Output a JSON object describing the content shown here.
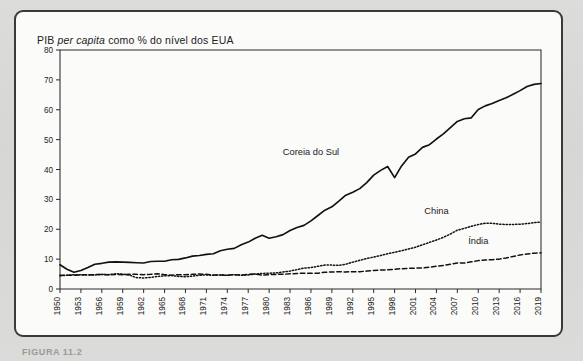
{
  "figure": {
    "title_prefix": "PIB ",
    "title_italic": "per capita",
    "title_suffix": " como % do nível dos EUA",
    "title_full": "PIB per capita como % do nível dos EUA",
    "caption": "FIGURA 11.2"
  },
  "chart_data": {
    "type": "line",
    "title": "PIB per capita como % do nível dos EUA",
    "xlabel": "",
    "ylabel": "",
    "ylim": [
      0,
      80
    ],
    "ytick_values": [
      0,
      10,
      20,
      30,
      40,
      50,
      60,
      70,
      80
    ],
    "ytick_labels": [
      "0",
      "10",
      "20",
      "30",
      "40",
      "50",
      "60",
      "70",
      "80"
    ],
    "xlim": [
      1950,
      2019
    ],
    "xtick_labels": [
      "1950",
      "1953",
      "1956",
      "1959",
      "1962",
      "1965",
      "1968",
      "1971",
      "1974",
      "1977",
      "1980",
      "1983",
      "1986",
      "1989",
      "1992",
      "1995",
      "1998",
      "2001",
      "2004",
      "2007",
      "2010",
      "2013",
      "2016",
      "2019"
    ],
    "grid": false,
    "legend_position": "inline-annotations",
    "x": [
      1950,
      1951,
      1952,
      1953,
      1954,
      1955,
      1956,
      1957,
      1958,
      1959,
      1960,
      1961,
      1962,
      1963,
      1964,
      1965,
      1966,
      1967,
      1968,
      1969,
      1970,
      1971,
      1972,
      1973,
      1974,
      1975,
      1976,
      1977,
      1978,
      1979,
      1980,
      1981,
      1982,
      1983,
      1984,
      1985,
      1986,
      1987,
      1988,
      1989,
      1990,
      1991,
      1992,
      1993,
      1994,
      1995,
      1996,
      1997,
      1998,
      1999,
      2000,
      2001,
      2002,
      2003,
      2004,
      2005,
      2006,
      2007,
      2008,
      2009,
      2010,
      2011,
      2012,
      2013,
      2014,
      2015,
      2016,
      2017,
      2018,
      2019
    ],
    "series": [
      {
        "name": "Coreia do Sul",
        "style": "solid",
        "label_x": 1986,
        "label_y": 45,
        "values": [
          8.1,
          6.6,
          5.6,
          6.2,
          7.2,
          8.3,
          8.6,
          9.0,
          9.1,
          9.0,
          8.9,
          8.8,
          8.7,
          9.2,
          9.3,
          9.3,
          9.8,
          9.9,
          10.4,
          11.0,
          11.2,
          11.6,
          11.8,
          12.8,
          13.3,
          13.6,
          14.8,
          15.7,
          17.0,
          18.0,
          17.0,
          17.5,
          18.2,
          19.6,
          20.6,
          21.3,
          22.8,
          24.6,
          26.4,
          27.5,
          29.4,
          31.4,
          32.4,
          33.6,
          35.6,
          38.1,
          39.7,
          41.0,
          37.3,
          41.2,
          44.1,
          45.2,
          47.4,
          48.3,
          50.2,
          51.9,
          54.0,
          56.1,
          57.0,
          57.3,
          60.1,
          61.3,
          62.1,
          63.1,
          64.0,
          65.2,
          66.4,
          67.8,
          68.5,
          68.8
        ]
      },
      {
        "name": "China",
        "style": "dotted",
        "label_x": 2004,
        "label_y": 25,
        "values": [
          4.4,
          4.6,
          4.8,
          4.8,
          4.7,
          4.7,
          4.9,
          4.8,
          5.1,
          5.0,
          4.6,
          3.8,
          3.7,
          3.9,
          4.2,
          4.4,
          4.5,
          4.2,
          4.1,
          4.3,
          4.6,
          4.7,
          4.6,
          4.7,
          4.6,
          4.8,
          4.6,
          4.7,
          5.0,
          5.2,
          5.3,
          5.4,
          5.7,
          6.0,
          6.5,
          7.0,
          7.2,
          7.6,
          8.0,
          8.0,
          7.9,
          8.3,
          9.0,
          9.6,
          10.2,
          10.7,
          11.2,
          11.8,
          12.3,
          12.8,
          13.4,
          14.0,
          14.8,
          15.6,
          16.4,
          17.3,
          18.4,
          19.7,
          20.3,
          21.0,
          21.6,
          22.0,
          22.0,
          21.7,
          21.6,
          21.6,
          21.7,
          21.9,
          22.2,
          22.4
        ]
      },
      {
        "name": "Índia",
        "style": "dashed",
        "label_x": 2010,
        "label_y": 15,
        "values": [
          4.6,
          4.6,
          4.6,
          4.7,
          4.8,
          4.8,
          4.9,
          4.7,
          4.9,
          4.8,
          4.9,
          4.9,
          4.8,
          4.9,
          5.1,
          4.8,
          4.6,
          4.8,
          4.8,
          4.9,
          5.0,
          4.9,
          4.7,
          4.7,
          4.6,
          4.8,
          4.7,
          4.9,
          5.0,
          4.6,
          4.8,
          4.9,
          4.9,
          5.1,
          5.2,
          5.3,
          5.3,
          5.3,
          5.6,
          5.7,
          5.8,
          5.7,
          5.8,
          5.8,
          6.0,
          6.2,
          6.4,
          6.4,
          6.6,
          6.8,
          6.9,
          7.0,
          7.0,
          7.3,
          7.6,
          7.9,
          8.3,
          8.7,
          8.7,
          9.1,
          9.5,
          9.7,
          9.8,
          10.0,
          10.4,
          10.9,
          11.4,
          11.7,
          12.0,
          12.1
        ]
      }
    ]
  }
}
